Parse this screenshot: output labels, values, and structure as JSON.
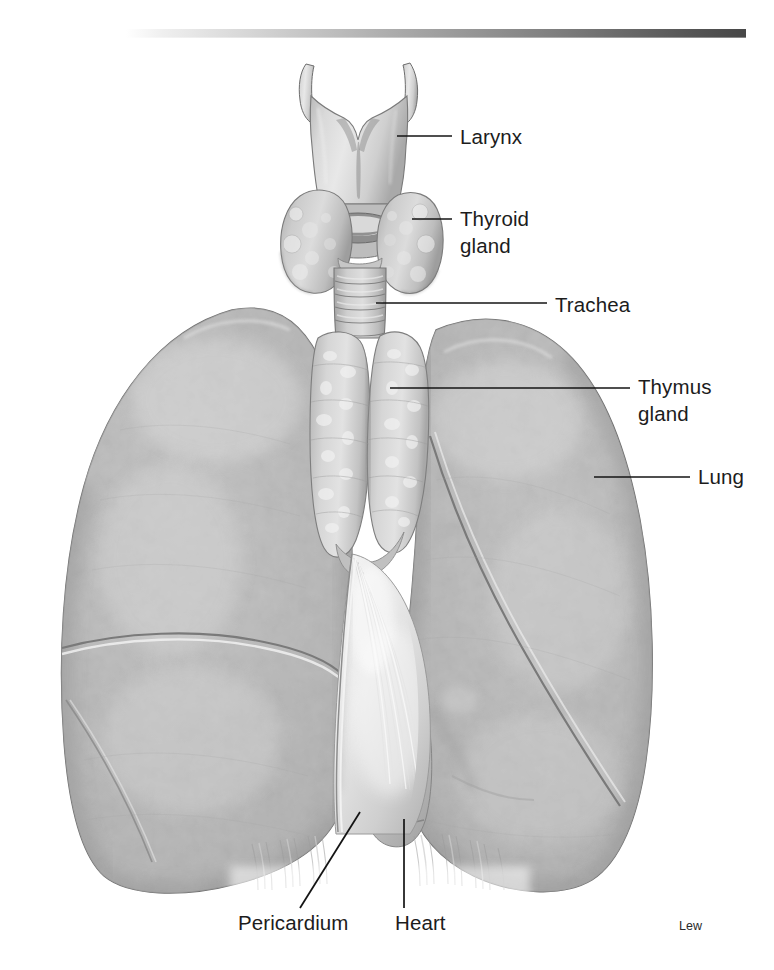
{
  "figure": {
    "title_bar": {
      "name": "top-gradient-rule",
      "start_color": "#f2f2f2",
      "end_color": "#4a4a4a"
    },
    "background_color": "#ffffff",
    "ink_color": "#141414",
    "signature": "Lew",
    "labels": [
      {
        "id": "larynx",
        "text": "Larynx",
        "lines": [
          "Larynx"
        ],
        "text_x": 460,
        "text_y": 144,
        "leader": [
          [
            397,
            136
          ],
          [
            452,
            136
          ]
        ]
      },
      {
        "id": "thyroid-gland",
        "text": "Thyroid gland",
        "lines": [
          "Thyroid",
          "gland"
        ],
        "text_x": 460,
        "text_y": 226,
        "leader": [
          [
            412,
            219
          ],
          [
            452,
            219
          ]
        ]
      },
      {
        "id": "trachea",
        "text": "Trachea",
        "lines": [
          "Trachea"
        ],
        "text_x": 555,
        "text_y": 312,
        "leader": [
          [
            376,
            303
          ],
          [
            547,
            303
          ]
        ]
      },
      {
        "id": "thymus-gland",
        "text": "Thymus gland",
        "lines": [
          "Thymus",
          "gland"
        ],
        "text_x": 638,
        "text_y": 394,
        "leader": [
          [
            390,
            388
          ],
          [
            630,
            388
          ]
        ]
      },
      {
        "id": "lung",
        "text": "Lung",
        "lines": [
          "Lung"
        ],
        "text_x": 698,
        "text_y": 484,
        "leader": [
          [
            594,
            477
          ],
          [
            690,
            477
          ]
        ]
      },
      {
        "id": "pericardium",
        "text": "Pericardium",
        "lines": [
          "Pericardium"
        ],
        "text_x": 238,
        "text_y": 930,
        "leader": [
          [
            360,
            812
          ],
          [
            300,
            908
          ]
        ]
      },
      {
        "id": "heart",
        "text": "Heart",
        "lines": [
          "Heart"
        ],
        "text_x": 395,
        "text_y": 930,
        "leader": [
          [
            404,
            819
          ],
          [
            404,
            908
          ]
        ]
      }
    ],
    "structures": [
      {
        "id": "larynx",
        "label": "Larynx"
      },
      {
        "id": "thyroid-gland",
        "label": "Thyroid gland"
      },
      {
        "id": "trachea",
        "label": "Trachea"
      },
      {
        "id": "thymus-gland",
        "label": "Thymus gland"
      },
      {
        "id": "lung-right",
        "label": "Lung"
      },
      {
        "id": "lung-left",
        "label": "Lung"
      },
      {
        "id": "pericardium",
        "label": "Pericardium"
      },
      {
        "id": "heart",
        "label": "Heart"
      }
    ]
  }
}
